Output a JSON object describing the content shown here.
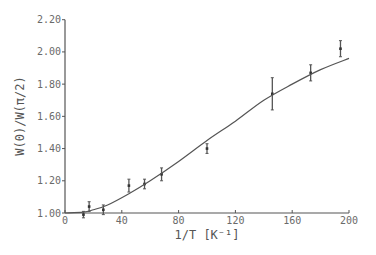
{
  "chart_data": {
    "type": "scatter",
    "title": "",
    "xlabel": "1/T [K⁻¹]",
    "ylabel": "W(0)/W(π/2)",
    "xlim": [
      0,
      200
    ],
    "ylim": [
      1.0,
      2.2
    ],
    "x_ticks": [
      0,
      40,
      80,
      120,
      160,
      200
    ],
    "x_tick_labels": [
      "0",
      "40",
      "80",
      "120",
      "160",
      "200"
    ],
    "y_ticks": [
      1.0,
      1.2,
      1.4,
      1.6,
      1.8,
      2.0,
      2.2
    ],
    "y_tick_labels": [
      "1.00",
      "1.20",
      "1.40",
      "1.60",
      "1.80",
      "2.00",
      "2.20"
    ],
    "grid": false,
    "legend": null,
    "series": [
      {
        "name": "measured",
        "kind": "points_with_error_bars",
        "x": [
          13,
          17,
          27,
          45,
          56,
          68,
          100,
          146,
          173,
          194
        ],
        "y": [
          0.99,
          1.04,
          1.02,
          1.17,
          1.18,
          1.24,
          1.4,
          1.74,
          1.87,
          2.02
        ],
        "yerr": [
          0.02,
          0.03,
          0.03,
          0.04,
          0.03,
          0.04,
          0.03,
          0.1,
          0.05,
          0.05
        ]
      },
      {
        "name": "fit",
        "kind": "line",
        "x": [
          0,
          13,
          20,
          30,
          45,
          60,
          80,
          100,
          120,
          140,
          160,
          180,
          200
        ],
        "y": [
          1.0,
          1.005,
          1.02,
          1.05,
          1.12,
          1.2,
          1.32,
          1.45,
          1.57,
          1.7,
          1.8,
          1.89,
          1.96
        ]
      }
    ]
  }
}
